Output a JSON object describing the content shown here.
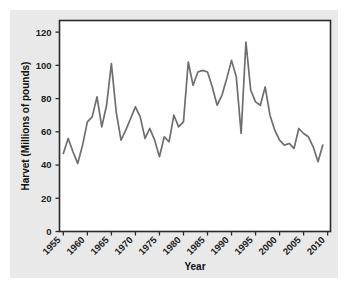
{
  "chart_data": {
    "type": "line",
    "title": "",
    "xlabel": "Year",
    "ylabel": "Harvet (Millions of pounds)",
    "xlim": [
      1954.2,
      2010.6
    ],
    "ylim": [
      0,
      127
    ],
    "grid": false,
    "legend": null,
    "xticks": [
      1955,
      1960,
      1965,
      1970,
      1975,
      1980,
      1985,
      1990,
      1995,
      2000,
      2005,
      2010
    ],
    "xtick_labels": [
      "1955",
      "1960",
      "1965",
      "1970",
      "1975",
      "1980",
      "1985",
      "1990",
      "1995",
      "2000",
      "2005",
      "2010"
    ],
    "xtick_rotation": 45,
    "yticks": [
      0,
      20,
      40,
      60,
      80,
      100,
      120
    ],
    "ytick_labels": [
      "0",
      "20",
      "40",
      "60",
      "80",
      "100",
      "120"
    ],
    "line_color": "#6e6e6e",
    "series": [
      {
        "name": "Harvest",
        "x": [
          1955,
          1956,
          1957,
          1958,
          1959,
          1960,
          1961,
          1962,
          1963,
          1964,
          1965,
          1966,
          1967,
          1968,
          1969,
          1970,
          1971,
          1972,
          1973,
          1974,
          1975,
          1976,
          1977,
          1978,
          1979,
          1980,
          1981,
          1982,
          1983,
          1984,
          1985,
          1986,
          1987,
          1988,
          1989,
          1990,
          1991,
          1992,
          1993,
          1994,
          1995,
          1996,
          1997,
          1998,
          1999,
          2000,
          2001,
          2002,
          2003,
          2004,
          2005,
          2006,
          2007,
          2008,
          2009
        ],
        "values": [
          47,
          56,
          48,
          41,
          52,
          66,
          69,
          81,
          63,
          76,
          101,
          72,
          55,
          61,
          68,
          75,
          69,
          56,
          62,
          55,
          45,
          57,
          54,
          70,
          63,
          66,
          102,
          88,
          96,
          97,
          96,
          87,
          76,
          82,
          92,
          103,
          93,
          59,
          114,
          85,
          78,
          76,
          87,
          70,
          61,
          55,
          52,
          53,
          50,
          62,
          59,
          57,
          51,
          42,
          52
        ]
      }
    ]
  },
  "axis": {
    "x_title": "Year",
    "y_title": "Harvet (Millions of pounds)"
  }
}
